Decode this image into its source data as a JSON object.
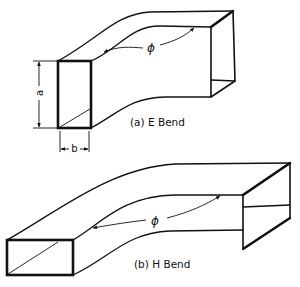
{
  "figure": {
    "e_bend": {
      "caption": "(a) E Bend",
      "angle_symbol": "ϕ",
      "dimension_a": "a",
      "dimension_b": "b"
    },
    "h_bend": {
      "caption": "(b) H Bend",
      "angle_symbol": "ϕ"
    }
  },
  "colors": {
    "line": "#111111",
    "background": "#ffffff"
  }
}
